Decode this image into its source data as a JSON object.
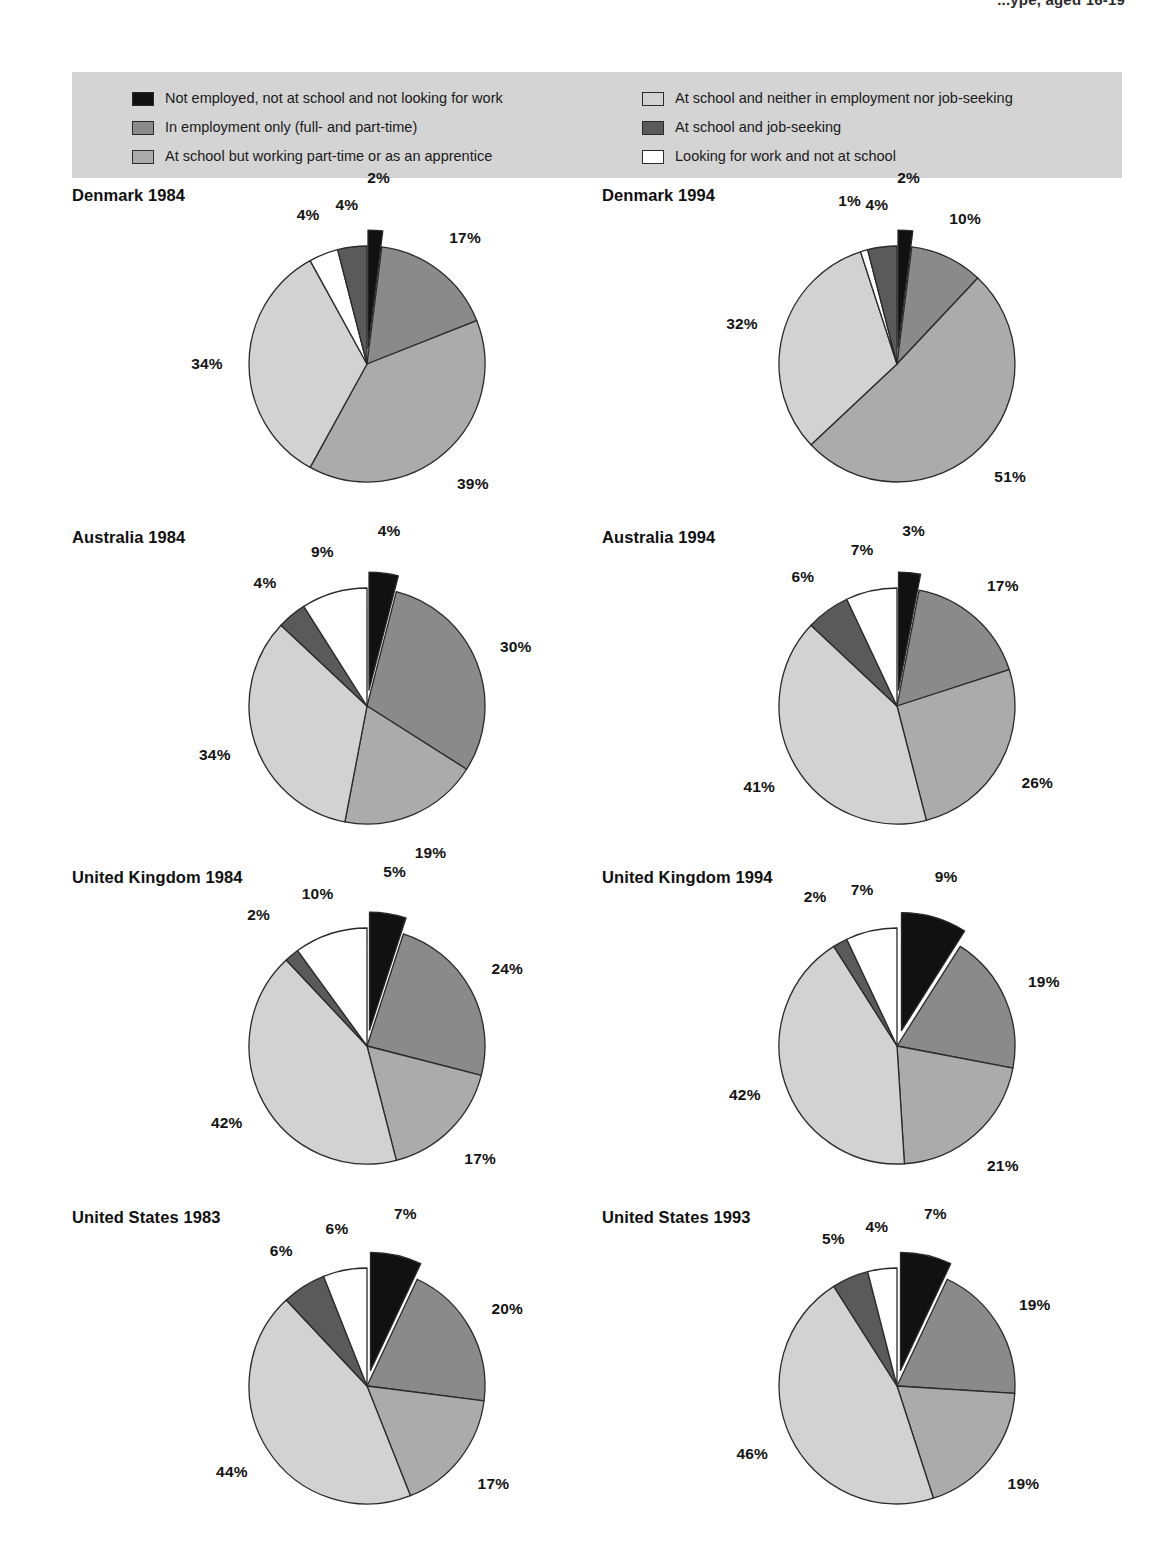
{
  "header": {
    "running_title": "...ype, aged 16-19"
  },
  "legend": {
    "background_color": "#d4d4d4",
    "columns": [
      {
        "items": [
          {
            "key": "not_employed_not_school_not_looking",
            "label": "Not employed, not at school and not looking for work",
            "color": "#111111"
          },
          {
            "key": "employment_only",
            "label": "In employment only (full- and part-time)",
            "color": "#8a8a8a"
          },
          {
            "key": "school_part_time_work",
            "label": "At school but working part-time or as an apprentice",
            "color": "#ababab"
          }
        ]
      },
      {
        "items": [
          {
            "key": "school_only",
            "label": "At school and neither in employment nor job-seeking",
            "color": "#d2d2d2"
          },
          {
            "key": "school_job_seeking",
            "label": "At school and job-seeking",
            "color": "#5a5a5a"
          },
          {
            "key": "looking_not_school",
            "label": "Looking for work and not at school",
            "color": "#ffffff"
          }
        ]
      }
    ]
  },
  "chart_data": {
    "type": "pie",
    "title": "",
    "value_suffix": "%",
    "categories": [
      "Not employed, not at school and not looking for work",
      "In employment only (full- and part-time)",
      "At school but working part-time or as an apprentice",
      "At school and neither in employment nor job-seeking",
      "At school and job-seeking",
      "Looking for work and not at school"
    ],
    "colors": [
      "#111111",
      "#8a8a8a",
      "#ababab",
      "#d2d2d2",
      "#5a5a5a",
      "#ffffff"
    ],
    "exploded_slice_index": 0,
    "start_angle_deg": -90,
    "direction": "clockwise",
    "panels": [
      {
        "title": "Denmark 1984",
        "slice_order": [
          0,
          1,
          2,
          3,
          5,
          4
        ],
        "slices": [
          {
            "category_index": 0,
            "value": 2,
            "label": "2%"
          },
          {
            "category_index": 1,
            "value": 17,
            "label": "17%"
          },
          {
            "category_index": 2,
            "value": 39,
            "label": "39%"
          },
          {
            "category_index": 3,
            "value": 34,
            "label": "34%"
          },
          {
            "category_index": 5,
            "value": 4,
            "label": "4%"
          },
          {
            "category_index": 4,
            "value": 4,
            "label": "4%"
          }
        ]
      },
      {
        "title": "Denmark 1994",
        "slice_order": [
          0,
          1,
          2,
          3,
          5,
          4
        ],
        "slices": [
          {
            "category_index": 0,
            "value": 2,
            "label": "2%"
          },
          {
            "category_index": 1,
            "value": 10,
            "label": "10%"
          },
          {
            "category_index": 2,
            "value": 51,
            "label": "51%"
          },
          {
            "category_index": 3,
            "value": 32,
            "label": "32%"
          },
          {
            "category_index": 5,
            "value": 1,
            "label": "1%"
          },
          {
            "category_index": 4,
            "value": 4,
            "label": "4%"
          }
        ]
      },
      {
        "title": "Australia 1984",
        "slice_order": [
          0,
          1,
          2,
          3,
          4,
          5
        ],
        "slices": [
          {
            "category_index": 0,
            "value": 4,
            "label": "4%"
          },
          {
            "category_index": 1,
            "value": 30,
            "label": "30%"
          },
          {
            "category_index": 2,
            "value": 19,
            "label": "19%"
          },
          {
            "category_index": 3,
            "value": 34,
            "label": "34%"
          },
          {
            "category_index": 4,
            "value": 4,
            "label": "4%"
          },
          {
            "category_index": 5,
            "value": 9,
            "label": "9%"
          }
        ]
      },
      {
        "title": "Australia 1994",
        "slice_order": [
          0,
          1,
          2,
          3,
          4,
          5
        ],
        "slices": [
          {
            "category_index": 0,
            "value": 3,
            "label": "3%"
          },
          {
            "category_index": 1,
            "value": 17,
            "label": "17%"
          },
          {
            "category_index": 2,
            "value": 26,
            "label": "26%"
          },
          {
            "category_index": 3,
            "value": 41,
            "label": "41%"
          },
          {
            "category_index": 4,
            "value": 6,
            "label": "6%"
          },
          {
            "category_index": 5,
            "value": 7,
            "label": "7%"
          }
        ]
      },
      {
        "title": "United Kingdom 1984",
        "slice_order": [
          0,
          1,
          2,
          3,
          4,
          5
        ],
        "slices": [
          {
            "category_index": 0,
            "value": 5,
            "label": "5%"
          },
          {
            "category_index": 1,
            "value": 24,
            "label": "24%"
          },
          {
            "category_index": 2,
            "value": 17,
            "label": "17%"
          },
          {
            "category_index": 3,
            "value": 42,
            "label": "42%"
          },
          {
            "category_index": 4,
            "value": 2,
            "label": "2%"
          },
          {
            "category_index": 5,
            "value": 10,
            "label": "10%"
          }
        ]
      },
      {
        "title": "United Kingdom 1994",
        "slice_order": [
          0,
          1,
          2,
          3,
          4,
          5
        ],
        "slices": [
          {
            "category_index": 0,
            "value": 9,
            "label": "9%"
          },
          {
            "category_index": 1,
            "value": 19,
            "label": "19%"
          },
          {
            "category_index": 2,
            "value": 21,
            "label": "21%"
          },
          {
            "category_index": 3,
            "value": 42,
            "label": "42%"
          },
          {
            "category_index": 4,
            "value": 2,
            "label": "2%"
          },
          {
            "category_index": 5,
            "value": 7,
            "label": "7%"
          }
        ]
      },
      {
        "title": "United States 1983",
        "slice_order": [
          0,
          1,
          2,
          3,
          4,
          5
        ],
        "slices": [
          {
            "category_index": 0,
            "value": 7,
            "label": "7%"
          },
          {
            "category_index": 1,
            "value": 20,
            "label": "20%"
          },
          {
            "category_index": 2,
            "value": 17,
            "label": "17%"
          },
          {
            "category_index": 3,
            "value": 44,
            "label": "44%"
          },
          {
            "category_index": 4,
            "value": 6,
            "label": "6%"
          },
          {
            "category_index": 5,
            "value": 6,
            "label": "6%"
          }
        ]
      },
      {
        "title": "United States 1993",
        "slice_order": [
          0,
          1,
          2,
          3,
          4,
          5
        ],
        "slices": [
          {
            "category_index": 0,
            "value": 7,
            "label": "7%"
          },
          {
            "category_index": 1,
            "value": 19,
            "label": "19%"
          },
          {
            "category_index": 2,
            "value": 19,
            "label": "19%"
          },
          {
            "category_index": 3,
            "value": 46,
            "label": "46%"
          },
          {
            "category_index": 4,
            "value": 5,
            "label": "5%"
          },
          {
            "category_index": 5,
            "value": 4,
            "label": "4%"
          }
        ]
      }
    ]
  }
}
